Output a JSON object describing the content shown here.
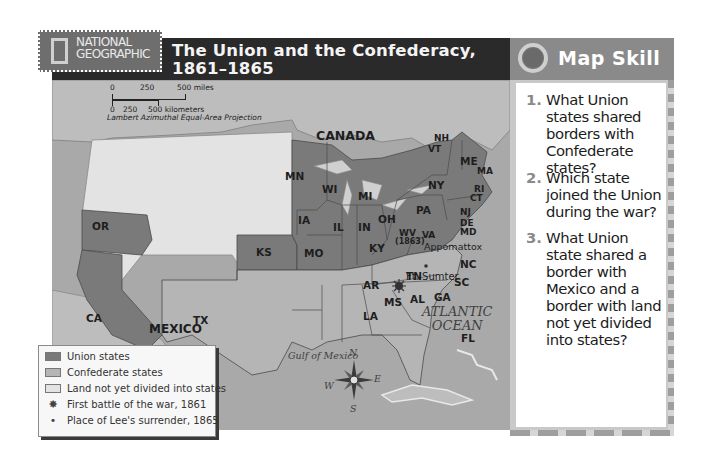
{
  "header": {
    "brand_line1": "NATIONAL",
    "brand_line2": "GEOGRAPHIC",
    "title_line1": "The Union and the Confederacy,",
    "title_line2": "1861–1865"
  },
  "scale": {
    "miles_ticks": [
      "0",
      "250",
      "500 miles"
    ],
    "km_ticks": [
      "0",
      "250",
      "500 kilometers"
    ],
    "projection": "Lambert Azimuthal Equal-Area Projection"
  },
  "map": {
    "regions": {
      "canada": "CANADA",
      "mexico": "MEXICO",
      "atlantic_line1": "ATLANTIC",
      "atlantic_line2": "OCEAN",
      "gulf": "Gulf of Mexico"
    },
    "union_states": [
      "OR",
      "CA",
      "KS",
      "MN",
      "WI",
      "IA",
      "MO",
      "IL",
      "MI",
      "IN",
      "OH",
      "KY",
      "WV",
      "PA",
      "NY",
      "NJ",
      "DE",
      "MD",
      "CT",
      "RI",
      "MA",
      "VT",
      "NH",
      "ME"
    ],
    "confederate_states": [
      "TX",
      "AR",
      "LA",
      "MS",
      "AL",
      "TN",
      "GA",
      "FL",
      "SC",
      "NC",
      "VA"
    ],
    "labels": {
      "OR": "OR",
      "CA": "CA",
      "KS": "KS",
      "TX": "TX",
      "MN": "MN",
      "WI": "WI",
      "IA": "IA",
      "MO": "MO",
      "IL": "IL",
      "MI": "MI",
      "IN": "IN",
      "OH": "OH",
      "KY": "KY",
      "WV": "WV",
      "WV_year": "(1863)",
      "VA": "VA",
      "PA": "PA",
      "NY": "NY",
      "NJ": "NJ",
      "DE": "DE",
      "MD": "MD",
      "CT": "CT",
      "RI": "RI",
      "MA": "MA",
      "VT": "VT",
      "NH": "NH",
      "ME": "ME",
      "TN": "TN",
      "NC": "NC",
      "SC": "SC",
      "GA": "GA",
      "AL": "AL",
      "MS": "MS",
      "AR": "AR",
      "LA": "LA",
      "FL": "FL"
    },
    "places": {
      "ft_sumter": "Ft. Sumter",
      "appomattox": "Appomattox"
    },
    "compass": {
      "n": "N",
      "s": "S",
      "e": "E",
      "w": "W"
    },
    "colors": {
      "union": "#7a7a7a",
      "confederate": "#b5b5b5",
      "territory": "#e3e3e3",
      "water": "#a9a9a9",
      "foreign": "#bdbdbd"
    }
  },
  "legend": {
    "items": [
      {
        "label": "Union states",
        "icon": "union-swatch"
      },
      {
        "label": "Confederate states",
        "icon": "confederate-swatch"
      },
      {
        "label": "Land not yet divided into states",
        "icon": "territory-swatch"
      },
      {
        "label": "First battle of the war, 1861",
        "icon": "battle-burst-icon"
      },
      {
        "label": "Place of Lee's surrender, 1865",
        "icon": "dot-icon"
      }
    ]
  },
  "map_skill": {
    "title": "Map Skill",
    "questions": [
      {
        "num": "1.",
        "text": "What Union states shared borders with Confederate states?"
      },
      {
        "num": "2.",
        "text": "Which state joined the Union during the war?"
      },
      {
        "num": "3.",
        "text": "What Union state shared a border with Mexico and a border with land not yet divided into states?"
      }
    ]
  }
}
